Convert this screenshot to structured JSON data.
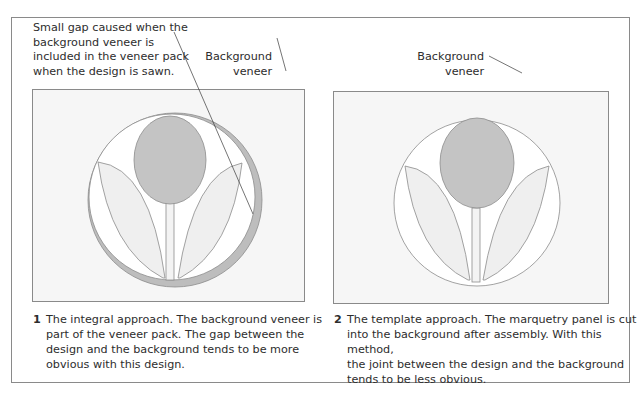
{
  "figure": {
    "panels": [
      {
        "number": "1",
        "annotation_gap": {
          "lines": [
            "Small gap caused when the",
            "background veneer is",
            "included in the veneer pack",
            "when the design is sawn."
          ]
        },
        "annotation_background": {
          "lines": [
            "Background",
            "veneer"
          ]
        },
        "caption": {
          "lines": [
            "The integral approach. The background veneer is",
            "part of the veneer pack. The gap between the",
            "design and the background tends to be more",
            "obvious with this design."
          ]
        }
      },
      {
        "number": "2",
        "annotation_background": {
          "lines": [
            "Background",
            "veneer"
          ]
        },
        "caption": {
          "lines": [
            "The template approach. The marquetry panel is cut",
            "into the background after assembly. With this method,",
            "the joint between the design and the background",
            "tends to be less obvious."
          ]
        }
      }
    ],
    "colors": {
      "frame": "#8a8a8a",
      "background_veneer": "#f6f6f6",
      "flower_head": "#c4c4c4",
      "leaf_fill": "#efefef",
      "gap_ring": "#bdbdbd",
      "line": "#8c8c8c"
    }
  }
}
